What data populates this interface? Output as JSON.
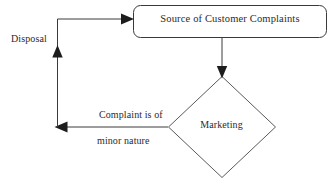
{
  "diagram": {
    "type": "flowchart",
    "background_color": "#ffffff",
    "stroke_color": "#3a3a3a",
    "text_color": "#2b2b2b",
    "nodes": [
      {
        "id": "source",
        "shape": "rounded-rectangle",
        "label": "Source of Customer Complaints",
        "x": 133,
        "y": 5,
        "width": 194,
        "height": 33
      },
      {
        "id": "marketing",
        "shape": "diamond",
        "label": "Marketing",
        "cx": 222,
        "cy": 127,
        "rx": 54,
        "ry": 51
      }
    ],
    "edges": [
      {
        "id": "source-to-marketing",
        "from": "source",
        "to": "marketing",
        "label": "",
        "direction": "down",
        "arrowhead": "filled-triangle"
      },
      {
        "id": "marketing-to-disposal",
        "from": "marketing",
        "to": "disposal-path",
        "label_line_1": "Complaint is of",
        "label_line_2": "minor nature",
        "direction": "left",
        "arrowhead": "filled-triangle"
      },
      {
        "id": "disposal-return",
        "from": "disposal-path",
        "to": "source",
        "label": "Disposal",
        "direction": "up-then-right",
        "arrowhead": "filled-triangle",
        "midpoint_arrowhead": "filled-triangle-up"
      }
    ],
    "labels": {
      "source_box": "Source of Customer Complaints",
      "marketing_diamond": "Marketing",
      "disposal": "Disposal",
      "edge_minor_line1": "Complaint is of",
      "edge_minor_line2": "minor nature"
    }
  }
}
